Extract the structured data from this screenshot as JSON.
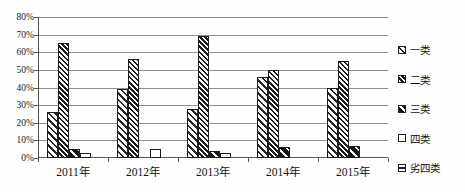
{
  "chart_data": {
    "type": "bar",
    "title": "",
    "xlabel": "",
    "ylabel": "",
    "categories": [
      "2011年",
      "2012年",
      "2013年",
      "2014年",
      "2015年"
    ],
    "series": [
      {
        "name": "一类",
        "pattern": "diagonal-wide",
        "values": [
          26,
          39,
          28,
          46,
          40
        ]
      },
      {
        "name": "二类",
        "pattern": "diagonal-dense",
        "values": [
          65,
          56,
          69,
          50,
          55
        ]
      },
      {
        "name": "三类",
        "pattern": "dark-diagonal",
        "values": [
          5,
          0,
          4,
          6,
          7
        ]
      },
      {
        "name": "四类",
        "pattern": "white",
        "values": [
          3,
          5,
          3,
          0,
          0
        ]
      },
      {
        "name": "劣四类",
        "pattern": "horizontal-lines",
        "values": [
          0,
          0,
          0,
          0,
          0
        ]
      }
    ],
    "unit": "%",
    "ylim": [
      0,
      80
    ],
    "ytick_step": 10,
    "yticks": [
      "0%",
      "10%",
      "20%",
      "30%",
      "40%",
      "50%",
      "60%",
      "70%",
      "80%"
    ],
    "grid": true,
    "legend_position": "right",
    "colors": {
      "ink": "#1a1a1a",
      "gridline": "#8f8f8f",
      "axis": "#555555",
      "background": "#fefefe"
    }
  }
}
